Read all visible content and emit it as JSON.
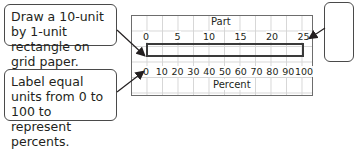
{
  "callouts": {
    "top_left": "Draw a 10-unit by 1-unit rectangle on grid paper.",
    "bottom_left": "Label equal units from 0 to 100 to represent percents."
  },
  "diagram": {
    "part_label": "Part",
    "percent_label": "Percent",
    "part_ticks": [
      "0",
      "5",
      "10",
      "15",
      "20",
      "25"
    ],
    "percent_ticks": [
      "0",
      "10",
      "20",
      "30",
      "40",
      "50",
      "60",
      "70",
      "80",
      "90",
      "100"
    ],
    "rectangle": {
      "width_units": 10,
      "height_units": 1
    }
  },
  "colors": {
    "border": "#4a4a4a",
    "grid": "#d6d6d6",
    "text": "#231f20"
  }
}
